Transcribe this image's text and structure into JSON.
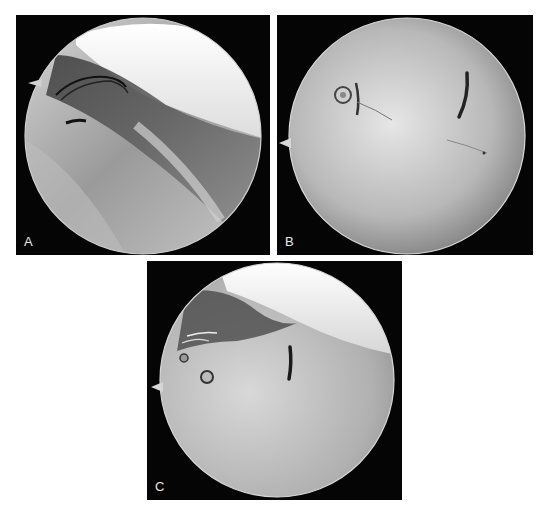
{
  "figure": {
    "panels": [
      {
        "id": "A",
        "label": "A",
        "view": "arthroscopic view with sutures and probe along tendon"
      },
      {
        "id": "B",
        "label": "B",
        "view": "arthroscopic view of surface with anchor eyelet and curved suture slit"
      },
      {
        "id": "C",
        "label": "C",
        "view": "arthroscopic view showing anchors, sutures and repaired surface"
      }
    ],
    "colors": {
      "background": "#ffffff",
      "panel_bg": "#050505",
      "label": "#e8e8e8"
    }
  }
}
